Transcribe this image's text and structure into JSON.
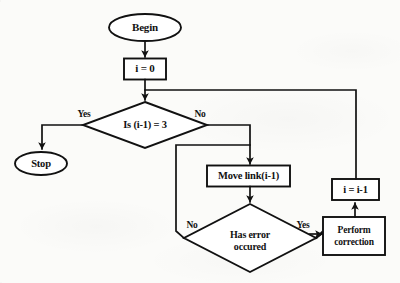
{
  "diagram": {
    "background_color": "#fbfbf9",
    "stroke_color": "#111111",
    "nodes": {
      "begin": {
        "label": "Begin",
        "shape": "terminator-oval"
      },
      "init": {
        "label": "i = 0",
        "shape": "process-rectangle"
      },
      "check_index": {
        "label": "Is (i-1) = 3",
        "shape": "decision-diamond"
      },
      "stop": {
        "label": "Stop",
        "shape": "terminator-oval"
      },
      "move_link": {
        "label": "Move link(i-1)",
        "shape": "process-rectangle"
      },
      "has_error": {
        "line1": "Has error",
        "line2": "occured",
        "shape": "decision-diamond"
      },
      "perform_correction": {
        "line1": "Perform",
        "line2": "correction",
        "shape": "process-rectangle"
      },
      "decrement": {
        "label": "i = i-1",
        "shape": "process-rectangle"
      }
    },
    "edge_labels": {
      "check_index_yes": "Yes",
      "check_index_no": "No",
      "has_error_no": "No",
      "has_error_yes": "Yes"
    }
  }
}
